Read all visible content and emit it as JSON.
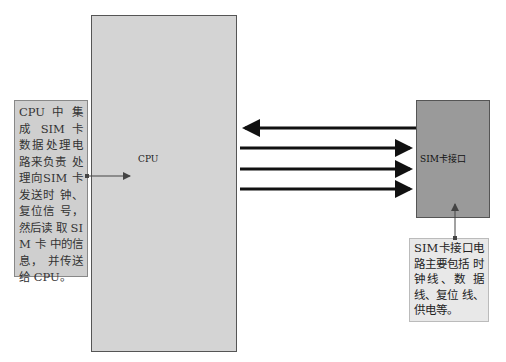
{
  "diagram": {
    "cpu_block": {
      "label": "CPU"
    },
    "sim_block": {
      "label": "SIM卡接口"
    },
    "left_note": {
      "text": "CPU 中 集 成 SIM 卡 数据处理电 路来负责 处理向SIM 卡发送时 钟、复位信 号，然后读 取 SIM 卡 中的信息， 并传送给 CPU。"
    },
    "right_note": {
      "text": "SIM卡接口电 路主要包括 时钟线、数 据线、复位 线、供电等。"
    },
    "connections": [
      {
        "direction": "sim-to-cpu",
        "y": 128
      },
      {
        "direction": "cpu-to-sim",
        "y": 148
      },
      {
        "direction": "cpu-to-sim",
        "y": 169
      },
      {
        "direction": "cpu-to-sim",
        "y": 189
      }
    ],
    "colors": {
      "cpu_fill": "#d4d4d4",
      "sim_fill": "#9a9a9a",
      "note_left_fill": "#cfcfcf",
      "note_right_fill": "#e8e8e8",
      "arrow": "#111111"
    }
  }
}
